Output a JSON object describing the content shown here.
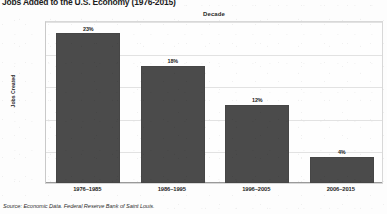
{
  "chart_data": {
    "type": "bar",
    "title": "Jobs Added to the U.S. Economy (1976-2015)",
    "xlabel": "Decade",
    "ylabel": "Jobs Created",
    "categories": [
      "1976–1985",
      "1986–1995",
      "1996–2005",
      "2006–2015"
    ],
    "values": [
      23,
      18,
      12,
      4
    ],
    "value_labels": [
      "23%",
      "18%",
      "12%",
      "4%"
    ],
    "ylim": [
      0,
      25
    ],
    "ytick_labels": [
      "0%",
      "5%",
      "10%",
      "15%",
      "20%",
      "25%"
    ],
    "ytick_values": [
      0,
      5,
      10,
      15,
      20,
      25
    ],
    "grid": true,
    "legend": "none",
    "bar_color": "#4b4b4b",
    "background_color": "#fdfdfd",
    "source": "Source: Economic Data. Federal Reserve Bank of Saint Louis."
  }
}
